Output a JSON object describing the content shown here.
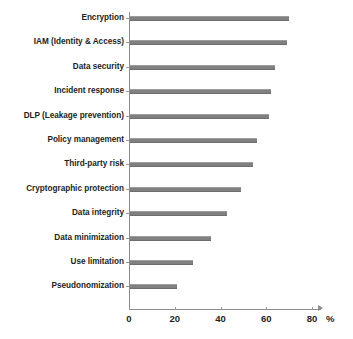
{
  "chart_data": {
    "type": "bar",
    "orientation": "horizontal",
    "title": "",
    "subtitle": "",
    "xlabel": "%",
    "ylabel": "",
    "xlim": [
      0,
      80
    ],
    "xticks": [
      0,
      20,
      40,
      60,
      80
    ],
    "xtick_labels": [
      "0",
      "20",
      "40",
      "60",
      "80"
    ],
    "grid": false,
    "legend": null,
    "legend_position": "none",
    "bar_color": "#808080",
    "axis_color": "#8c8c8c",
    "text_color": "#231f20",
    "background": "#ffffff",
    "categories": [
      "Encryption",
      "IAM (Identity & Access)",
      "Data security",
      "Incident response",
      "DLP (Leakage prevention)",
      "Policy management",
      "Third-party risk",
      "Cryptographic protection",
      "Data integrity",
      "Data minimization",
      "Use limitation",
      "Pseudonomization"
    ],
    "values": [
      70,
      69,
      64,
      62,
      61,
      56,
      54,
      49,
      43,
      36,
      28,
      21
    ],
    "series": [
      {
        "name": "Share of respondents",
        "values": [
          70,
          69,
          64,
          62,
          61,
          56,
          54,
          49,
          43,
          36,
          28,
          21
        ]
      }
    ]
  },
  "axis": {
    "unit_symbol": "%"
  }
}
